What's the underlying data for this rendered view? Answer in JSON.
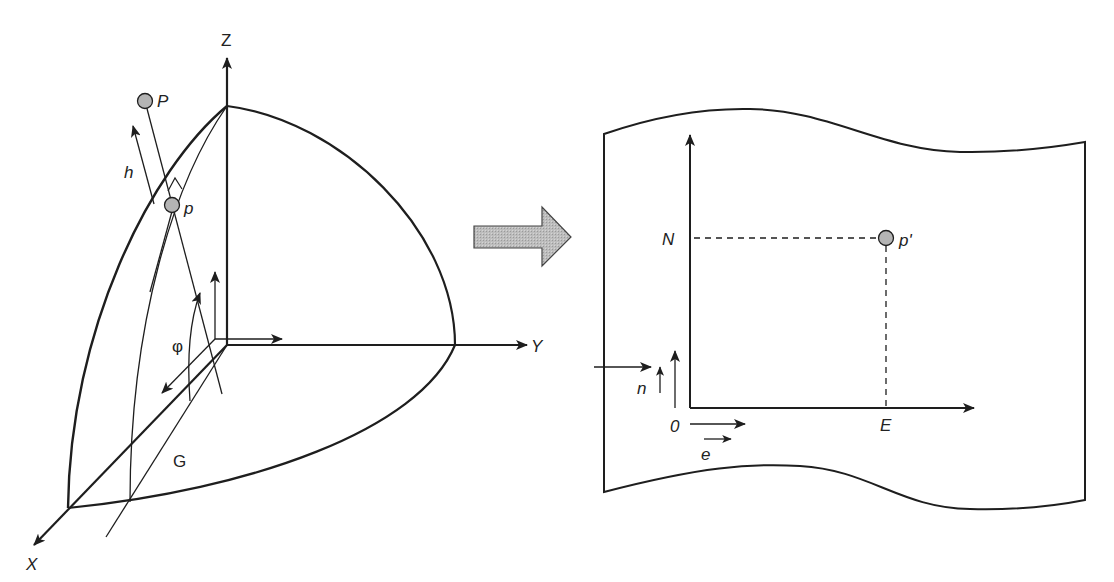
{
  "diagram": {
    "colors": {
      "stroke": "#1e1e1e",
      "point_fill": "#b4b4b4",
      "arrow_fill": "#b9b9b9"
    },
    "ellipsoid": {
      "axes": {
        "x": "X",
        "y": "Y",
        "z": "Z"
      },
      "points": {
        "surface_point": "P",
        "projected_point": "p"
      },
      "labels": {
        "height": "h",
        "latitude": "φ",
        "greenwich": "G"
      }
    },
    "transition_arrow": "projection",
    "map_plane": {
      "axes": {
        "north": "N",
        "east": "E",
        "origin": "0"
      },
      "point": "p'",
      "unit_vectors": {
        "north": "n",
        "east": "e"
      }
    }
  }
}
